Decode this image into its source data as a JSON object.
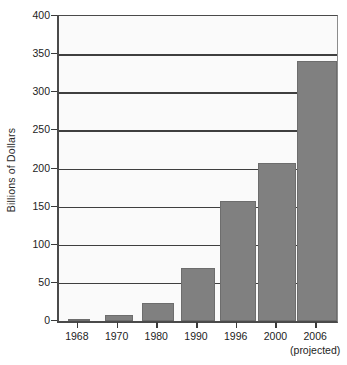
{
  "chart_data": {
    "type": "bar",
    "title": "",
    "subtitle": "",
    "xlabel": "",
    "ylabel": "Billions of Dollars",
    "categories": [
      "1968",
      "1970",
      "1980",
      "1990",
      "1996",
      "2000",
      "2006"
    ],
    "category_sublabels": [
      "",
      "",
      "",
      "",
      "",
      "",
      "(projected)"
    ],
    "values": [
      3,
      8,
      24,
      70,
      158,
      207,
      341
    ],
    "ylim": [
      0,
      400
    ],
    "yticks": [
      0,
      50,
      100,
      150,
      200,
      250,
      300,
      350,
      400
    ],
    "ytick_labels": [
      "0",
      "50",
      "100",
      "150",
      "200",
      "250",
      "300",
      "350",
      "400"
    ],
    "grid": true,
    "grid_axis": "y",
    "legend": false,
    "legend_position": "none",
    "bar_color": "#808080",
    "bar_edge_color": "#6d6d6d",
    "plot_background": "#fafafa",
    "axis_color": "#4a4a4a",
    "text_color": "#1d1d1d",
    "bar_widths_px": [
      22,
      28,
      32,
      34,
      36,
      38,
      40
    ]
  }
}
